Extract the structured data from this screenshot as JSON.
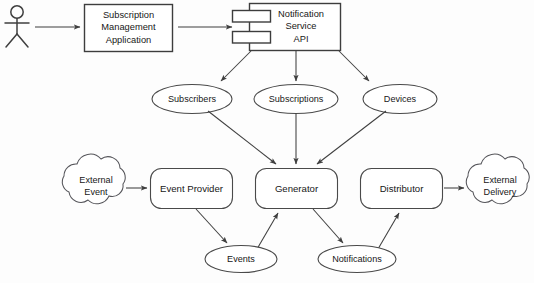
{
  "diagram": {
    "background_color": "#fdfdfd",
    "stroke_color": "#3f3f3f",
    "text_color": "#171717",
    "actor": {
      "name": "user-actor",
      "label": ""
    },
    "nodes": [
      {
        "id": "subscription-management-application",
        "kind": "rectangle",
        "label_lines": [
          "Subscription",
          "Management",
          "Application"
        ]
      },
      {
        "id": "notification-service-api",
        "kind": "uml-component",
        "label_lines": [
          "Notification",
          "Service",
          "API"
        ]
      },
      {
        "id": "subscribers",
        "kind": "ellipse",
        "label_lines": [
          "Subscribers"
        ]
      },
      {
        "id": "subscriptions",
        "kind": "ellipse",
        "label_lines": [
          "Subscriptions"
        ]
      },
      {
        "id": "devices",
        "kind": "ellipse",
        "label_lines": [
          "Devices"
        ]
      },
      {
        "id": "external-event",
        "kind": "cloud",
        "label_lines": [
          "External",
          "Event"
        ]
      },
      {
        "id": "event-provider",
        "kind": "rounded-rectangle",
        "label_lines": [
          "Event Provider"
        ]
      },
      {
        "id": "generator",
        "kind": "rounded-rectangle",
        "label_lines": [
          "Generator"
        ]
      },
      {
        "id": "distributor",
        "kind": "rounded-rectangle",
        "label_lines": [
          "Distributor"
        ]
      },
      {
        "id": "external-delivery",
        "kind": "cloud",
        "label_lines": [
          "External",
          "Delivery"
        ]
      },
      {
        "id": "events",
        "kind": "ellipse",
        "label_lines": [
          "Events"
        ]
      },
      {
        "id": "notifications",
        "kind": "ellipse",
        "label_lines": [
          "Notifications"
        ]
      }
    ],
    "edges": [
      {
        "from": "user-actor",
        "to": "subscription-management-application"
      },
      {
        "from": "subscription-management-application",
        "to": "notification-service-api"
      },
      {
        "from": "notification-service-api",
        "to": "subscribers"
      },
      {
        "from": "notification-service-api",
        "to": "subscriptions"
      },
      {
        "from": "notification-service-api",
        "to": "devices"
      },
      {
        "from": "subscribers",
        "to": "generator"
      },
      {
        "from": "subscriptions",
        "to": "generator"
      },
      {
        "from": "devices",
        "to": "generator"
      },
      {
        "from": "external-event",
        "to": "event-provider"
      },
      {
        "from": "event-provider",
        "to": "events"
      },
      {
        "from": "events",
        "to": "generator"
      },
      {
        "from": "generator",
        "to": "notifications"
      },
      {
        "from": "notifications",
        "to": "distributor"
      },
      {
        "from": "distributor",
        "to": "external-delivery"
      }
    ]
  }
}
